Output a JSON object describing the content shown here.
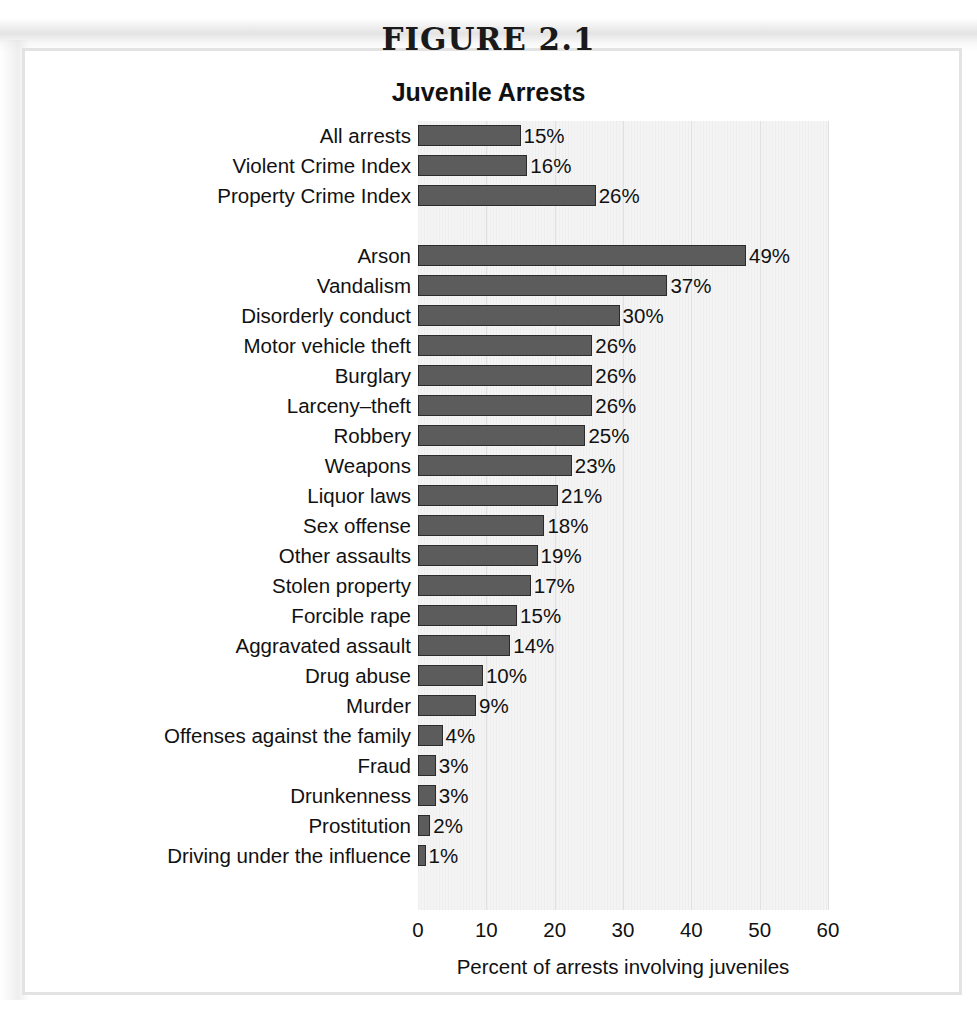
{
  "figure": {
    "number_label": "FIGURE 2.1",
    "title": "Juvenile Arrests"
  },
  "chart_data": {
    "type": "bar",
    "orientation": "horizontal",
    "title": "Juvenile Arrests",
    "xlabel": "Percent of arrests involving juveniles",
    "ylabel": "",
    "xlim": [
      0,
      60
    ],
    "xticks": [
      0,
      10,
      20,
      30,
      40,
      50,
      60
    ],
    "grid": "vertical",
    "legend": "none",
    "value_suffix": "%",
    "groups": [
      {
        "name": "summary",
        "categories": [
          "All arrests",
          "Violent Crime Index",
          "Property Crime Index"
        ],
        "values": [
          15,
          16,
          26
        ],
        "labels": [
          "15%",
          "16%",
          "26%"
        ],
        "bar_lengths": [
          15.0,
          16.0,
          26.0
        ]
      },
      {
        "name": "offenses",
        "categories": [
          "Arson",
          "Vandalism",
          "Disorderly conduct",
          "Motor vehicle theft",
          "Burglary",
          "Larceny–theft",
          "Robbery",
          "Weapons",
          "Liquor laws",
          "Sex offense",
          "Other assaults",
          "Stolen property",
          "Forcible rape",
          "Aggravated assault",
          "Drug abuse",
          "Murder",
          "Offenses against the family",
          "Fraud",
          "Drunkenness",
          "Prostitution",
          "Driving under the influence"
        ],
        "values": [
          49,
          37,
          30,
          26,
          26,
          26,
          25,
          23,
          21,
          18,
          19,
          17,
          15,
          14,
          10,
          9,
          4,
          3,
          3,
          2,
          1
        ],
        "labels": [
          "49%",
          "37%",
          "30%",
          "26%",
          "26%",
          "26%",
          "25%",
          "23%",
          "21%",
          "18%",
          "19%",
          "17%",
          "15%",
          "14%",
          "10%",
          "9%",
          "4%",
          "3%",
          "3%",
          "2%",
          "1%"
        ],
        "bar_lengths": [
          48,
          36.5,
          29.5,
          25.5,
          25.5,
          25.5,
          24.5,
          22.5,
          20.5,
          18.5,
          17.5,
          16.5,
          14.5,
          13.5,
          9.5,
          8.5,
          3.6,
          2.6,
          2.6,
          1.8,
          1.1
        ]
      }
    ],
    "colors": {
      "bar_fill": "#5c5c5c",
      "bar_edge": "#2b2b2b",
      "plot_background": "#f4f4f4",
      "gridline": "#e0e0e0",
      "text": "#111111"
    }
  }
}
